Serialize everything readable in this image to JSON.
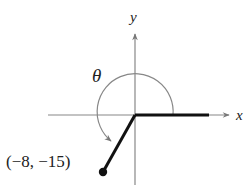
{
  "diagram": {
    "type": "angle-in-standard-position",
    "axes": {
      "x_label": "x",
      "y_label": "y"
    },
    "angle_label": "θ",
    "point": {
      "label": "(−8, −15)",
      "x": -8,
      "y": -15
    },
    "colors": {
      "axis": "#777777",
      "ray": "#111111",
      "arc": "#777777",
      "text": "#222222"
    }
  }
}
